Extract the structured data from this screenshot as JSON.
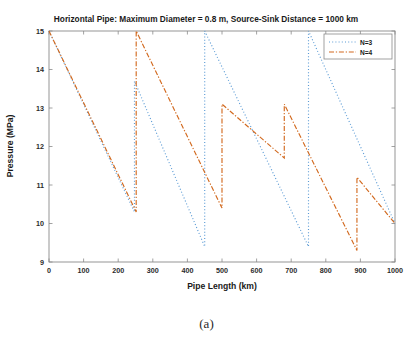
{
  "figure": {
    "caption": "(a)",
    "background_color": "#ffffff"
  },
  "chart_data": {
    "type": "line",
    "title": "Horizontal Pipe: Maximum Diameter = 0.8 m, Source-Sink Distance = 1000 km",
    "xlabel": "Pipe Length (km)",
    "ylabel": "Pressure (MPa)",
    "xlim": [
      0,
      1000
    ],
    "ylim": [
      9,
      15
    ],
    "xticks": [
      0,
      100,
      200,
      300,
      400,
      500,
      600,
      700,
      800,
      900,
      1000
    ],
    "yticks": [
      9,
      10,
      11,
      12,
      13,
      14,
      15
    ],
    "grid": false,
    "legend_position": "top-right",
    "series": [
      {
        "name": "N=3",
        "color": "#5b9bd5",
        "style": "dotted",
        "points": [
          [
            0,
            15.0
          ],
          [
            247,
            10.3
          ],
          [
            247,
            13.7
          ],
          [
            450,
            9.4
          ],
          [
            450,
            15.0
          ],
          [
            750,
            9.4
          ],
          [
            750,
            15.0
          ],
          [
            1000,
            10.0
          ]
        ]
      },
      {
        "name": "N=4",
        "color": "#d2691e",
        "style": "dash-dot",
        "points": [
          [
            0,
            15.0
          ],
          [
            252,
            10.3
          ],
          [
            252,
            15.0
          ],
          [
            500,
            10.4
          ],
          [
            500,
            13.1
          ],
          [
            680,
            11.7
          ],
          [
            680,
            13.1
          ],
          [
            890,
            9.3
          ],
          [
            890,
            11.2
          ],
          [
            1000,
            10.0
          ]
        ]
      }
    ]
  }
}
